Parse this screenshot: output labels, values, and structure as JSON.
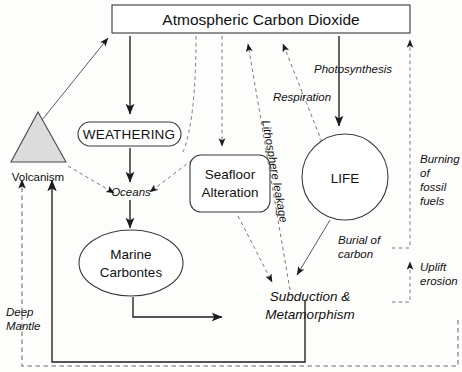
{
  "diagram": {
    "nodes": {
      "atmosphere": "Atmospheric Carbon Dioxide",
      "weathering": "WEATHERING",
      "volcanism": "Volcanism",
      "oceans": "Oceans",
      "seafloor_line1": "Seafloor",
      "seafloor_line2": "Alteration",
      "life": "LIFE",
      "marine_line1": "Marine",
      "marine_line2": "Carbontes",
      "subduction_line1": "Subduction &",
      "subduction_line2": "Metamorphism"
    },
    "edge_labels": {
      "photosynthesis": "Photosynthesis",
      "respiration": "Respiration",
      "lithosphere_leakage": "Lithosphere leakage",
      "burning_line1": "Burning",
      "burning_line2": "of",
      "burning_line3": "fossil",
      "burning_line4": "fuels",
      "burial_line1": "Burial of",
      "burial_line2": "carbon",
      "uplift_line1": "Uplift",
      "uplift_line2": "erosion",
      "deep_mantle_line1": "Deep",
      "deep_mantle_line2": "Mantle"
    },
    "colors": {
      "background": "#fdfdfc",
      "node_stroke": "#3a3a3a",
      "triangle_fill": "#dcdcdc",
      "solid_arrow": "#1c1c1c",
      "dashed_arrow": "#6d6d6d",
      "text": "#111111"
    }
  }
}
